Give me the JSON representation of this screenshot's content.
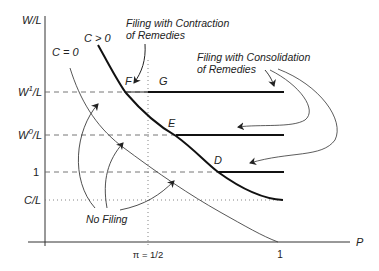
{
  "diagram": {
    "axes": {
      "y_label": "W/L",
      "x_label": "P",
      "y_ticks": [
        {
          "label": "W¹/L",
          "base": "W",
          "sup": "1",
          "tail": "/L",
          "style": "dashed"
        },
        {
          "label": "W⁰/L",
          "base": "W",
          "sup": "0",
          "tail": "/L",
          "style": "dashed"
        },
        {
          "label": "1",
          "style": "dashed"
        },
        {
          "label": "C/L",
          "style": "dotted"
        }
      ],
      "x_ticks": [
        {
          "label": "π = 1/2",
          "style": "dotted"
        },
        {
          "label": "1"
        }
      ]
    },
    "curves": {
      "c_positive": "C > 0",
      "c_zero": "C = 0"
    },
    "points": {
      "F": "F",
      "G": "G",
      "E": "E",
      "D": "D"
    },
    "annotations": {
      "contraction_line1": "Filing with Contraction",
      "contraction_line2": "of Remedies",
      "consolidation_line1": "Filing with Consolidation",
      "consolidation_line2": "of Remedies",
      "no_filing": "No Filing"
    },
    "colors": {
      "ink": "#222222",
      "thin": "#444444",
      "guide": "#666666"
    }
  }
}
